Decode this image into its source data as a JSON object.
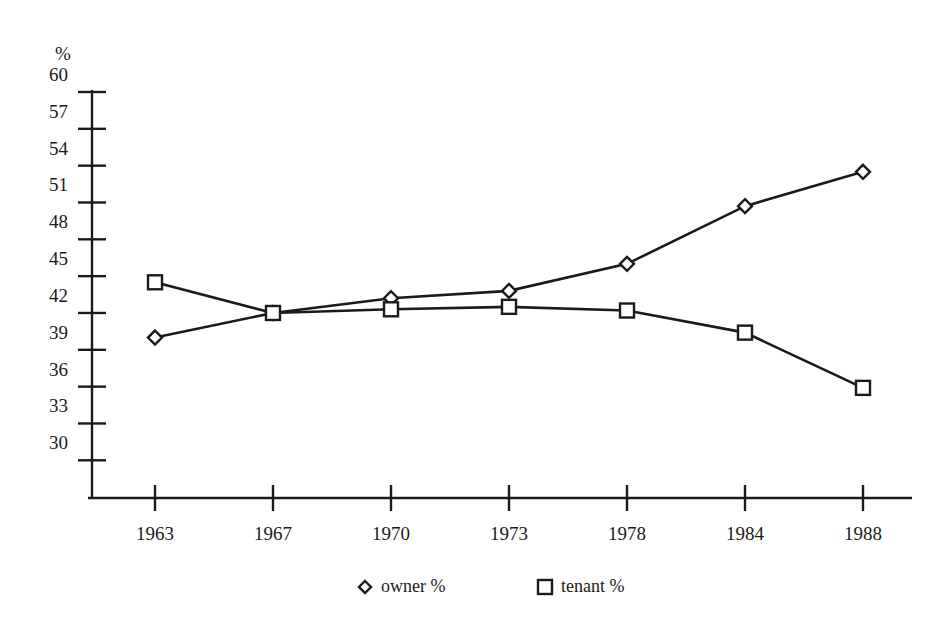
{
  "chart_data": {
    "type": "line",
    "title": "",
    "subtitle": "",
    "xlabel": "",
    "ylabel": "%",
    "categories": [
      "1963",
      "1967",
      "1970",
      "1973",
      "1978",
      "1984",
      "1988"
    ],
    "series": [
      {
        "name": "owner %",
        "marker": "diamond",
        "values": [
          40,
          42,
          43.2,
          43.8,
          46,
          50.7,
          53.5
        ]
      },
      {
        "name": "tenant %",
        "marker": "square",
        "values": [
          44.5,
          42,
          42.3,
          42.5,
          42.2,
          40.4,
          35.9
        ]
      }
    ],
    "ylim": [
      30,
      60
    ],
    "ytick_labels": [
      "60",
      "57",
      "54",
      "51",
      "48",
      "45",
      "42",
      "39",
      "36",
      "33",
      "30"
    ],
    "ytick_values": [
      60,
      57,
      54,
      51,
      48,
      45,
      42,
      39,
      36,
      33,
      30
    ],
    "ytick_step": 3,
    "grid": false,
    "legend_position": "bottom",
    "legend_entries": [
      {
        "label": "owner %",
        "marker": "diamond"
      },
      {
        "label": "tenant %",
        "marker": "square"
      }
    ],
    "colors": {
      "ink": "#1a1a1a",
      "background": "#ffffff",
      "marker_fill": "#ffffff"
    }
  }
}
